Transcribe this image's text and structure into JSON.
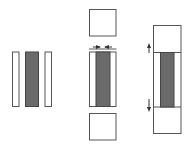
{
  "diagram": {
    "colors": {
      "stroke": "#555555",
      "dark_fill": "#6a6a6a",
      "light_fill": "#ffffff",
      "arrow": "#333333"
    },
    "panels": [
      {
        "id": "left",
        "parts": [
          "thin-white-bar-left",
          "dark-bar",
          "thin-white-bar-right"
        ],
        "layout": "separated"
      },
      {
        "id": "middle",
        "parts": [
          "top-square",
          "combined-bar",
          "bottom-square"
        ],
        "arrows": [
          "inward-left",
          "inward-right"
        ],
        "layout": "pressed together, squares separated"
      },
      {
        "id": "right",
        "parts": [
          "top-section",
          "combined-bar",
          "bottom-section"
        ],
        "arrows": [
          "up",
          "down"
        ],
        "layout": "fully assembled column"
      }
    ]
  }
}
